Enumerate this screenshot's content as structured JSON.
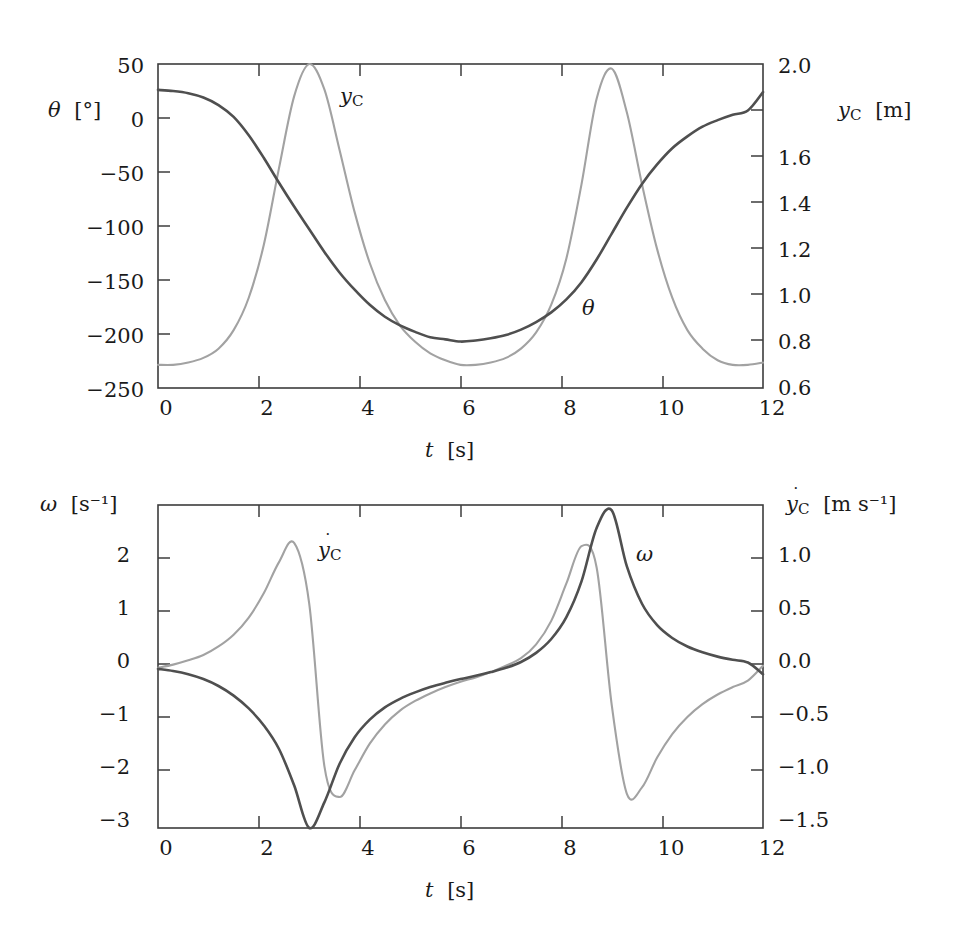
{
  "figure": {
    "background": "#ffffff",
    "curve_colors": {
      "dark": "#4f4f4f",
      "light": "#a2a2a2"
    },
    "axis_color": "#3c3c3c"
  },
  "panels": [
    {
      "id": "top",
      "x_axis": {
        "label_main": "t",
        "label_unit": "[s]",
        "ticks": [
          0,
          2,
          4,
          6,
          8,
          10,
          12
        ],
        "tick_labels": [
          "0",
          "2",
          "4",
          "6",
          "8",
          "10",
          "12"
        ],
        "range": [
          0,
          12
        ]
      },
      "left_axis": {
        "label_main": "θ",
        "label_unit": "[°]",
        "ticks": [
          50,
          0,
          -50,
          -100,
          -150,
          -200,
          -250
        ],
        "tick_labels": [
          "50",
          "0",
          "−50",
          "−100",
          "−150",
          "−200",
          "−250"
        ],
        "range": [
          -250,
          50
        ]
      },
      "right_axis": {
        "label_main": "y",
        "label_sub": "C",
        "label_unit": "[m]",
        "ticks": [
          2.0,
          1.8,
          1.6,
          1.4,
          1.2,
          1.0,
          0.8,
          0.6
        ],
        "tick_labels": [
          "2.0",
          "",
          "1.6",
          "1.4",
          "1.2",
          "1.0",
          "0.8",
          "0.6"
        ],
        "range": [
          0.6,
          2.0
        ]
      },
      "annotations": [
        {
          "name": "y_C",
          "text_main": "y",
          "text_sub": "C",
          "x": 340,
          "y": 96
        },
        {
          "name": "theta",
          "text_main": "θ",
          "text_sub": "",
          "x": 582,
          "y": 300
        }
      ]
    },
    {
      "id": "bottom",
      "x_axis": {
        "label_main": "t",
        "label_unit": "[s]",
        "ticks": [
          0,
          2,
          4,
          6,
          8,
          10,
          12
        ],
        "tick_labels": [
          "0",
          "2",
          "4",
          "6",
          "8",
          "10",
          "12"
        ],
        "range": [
          0,
          12
        ]
      },
      "left_axis": {
        "label_main": "ω",
        "label_unit": "[s⁻¹]",
        "ticks": [
          2,
          1,
          0,
          -1,
          -2,
          -3
        ],
        "tick_labels": [
          "2",
          "1",
          "0",
          "−1",
          "−2",
          "−3"
        ],
        "range": [
          -3.0,
          3.05
        ]
      },
      "right_axis": {
        "label_main": "y",
        "label_sub": "C",
        "label_unit": "[m s⁻¹]",
        "ticks": [
          1.0,
          0.5,
          0.0,
          -0.5,
          -1.0,
          -1.5
        ],
        "tick_labels": [
          "1.0",
          "0.5",
          "0.0",
          "−0.5",
          "−1.0",
          "−1.5"
        ],
        "range": [
          -1.5,
          1.525
        ]
      },
      "annotations": [
        {
          "name": "ydot_C",
          "text_main": "y",
          "text_sub": "C",
          "x": 318,
          "y": 548
        },
        {
          "name": "omega",
          "text_main": "ω",
          "text_sub": "",
          "x": 636,
          "y": 550
        }
      ]
    }
  ],
  "chart_data": [
    {
      "type": "line",
      "panel": "top",
      "title": "",
      "xlabel": "t [s]",
      "ylabel": "θ [°]",
      "ylabel_right": "y_C [m]",
      "xlim": [
        0,
        12
      ],
      "ylim": [
        -250,
        50
      ],
      "ylim_right": [
        0.6,
        2.0
      ],
      "grid": false,
      "legend": "inline annotations",
      "series": [
        {
          "name": "θ",
          "axis": "left",
          "unit": "deg",
          "color": "#4f4f4f",
          "x": [
            0.0,
            0.3,
            0.6,
            0.9,
            1.2,
            1.5,
            1.8,
            2.1,
            2.4,
            2.7,
            3.0,
            3.3,
            3.6,
            3.9,
            4.2,
            4.5,
            4.8,
            5.1,
            5.4,
            5.7,
            6.0,
            6.3,
            6.6,
            6.9,
            7.2,
            7.5,
            7.8,
            8.1,
            8.4,
            8.7,
            9.0,
            9.3,
            9.6,
            9.9,
            10.2,
            10.5,
            10.8,
            11.1,
            11.4,
            11.7,
            12.0
          ],
          "y": [
            26,
            25,
            23,
            19,
            12,
            1,
            -16,
            -37,
            -60,
            -82,
            -103,
            -124,
            -143,
            -159,
            -173,
            -184,
            -192,
            -198,
            -203,
            -205,
            -207,
            -206,
            -204,
            -201,
            -196,
            -189,
            -180,
            -168,
            -152,
            -131,
            -107,
            -83,
            -61,
            -43,
            -28,
            -17,
            -8,
            -2,
            3,
            7,
            24
          ]
        },
        {
          "name": "y_C",
          "axis": "right",
          "unit": "m",
          "color": "#a2a2a2",
          "x": [
            0.0,
            0.3,
            0.6,
            0.9,
            1.2,
            1.5,
            1.8,
            2.1,
            2.4,
            2.7,
            3.0,
            3.3,
            3.6,
            3.9,
            4.2,
            4.5,
            4.8,
            5.1,
            5.4,
            5.7,
            6.0,
            6.3,
            6.6,
            6.9,
            7.2,
            7.5,
            7.8,
            8.1,
            8.4,
            8.7,
            9.0,
            9.3,
            9.6,
            9.9,
            10.2,
            10.5,
            10.8,
            11.1,
            11.4,
            11.7,
            12.0
          ],
          "y": [
            0.7,
            0.7,
            0.71,
            0.73,
            0.77,
            0.85,
            0.99,
            1.22,
            1.55,
            1.86,
            2.0,
            1.89,
            1.63,
            1.36,
            1.14,
            0.98,
            0.87,
            0.8,
            0.75,
            0.72,
            0.7,
            0.7,
            0.71,
            0.73,
            0.77,
            0.84,
            0.96,
            1.16,
            1.48,
            1.85,
            1.98,
            1.79,
            1.48,
            1.2,
            0.99,
            0.85,
            0.77,
            0.72,
            0.7,
            0.7,
            0.71
          ]
        }
      ]
    },
    {
      "type": "line",
      "panel": "bottom",
      "title": "",
      "xlabel": "t [s]",
      "ylabel": "ω [s⁻¹]",
      "ylabel_right": "ẏ_C [m s⁻¹]",
      "xlim": [
        0,
        12
      ],
      "ylim": [
        -3.0,
        3.05
      ],
      "ylim_right": [
        -1.5,
        1.525
      ],
      "grid": false,
      "legend": "inline annotations",
      "series": [
        {
          "name": "ω",
          "axis": "left",
          "unit": "s^-1",
          "color": "#4f4f4f",
          "x": [
            0.0,
            0.3,
            0.6,
            0.9,
            1.2,
            1.5,
            1.8,
            2.1,
            2.4,
            2.7,
            3.0,
            3.3,
            3.6,
            3.9,
            4.2,
            4.5,
            4.8,
            5.1,
            5.4,
            5.7,
            6.0,
            6.3,
            6.6,
            6.9,
            7.2,
            7.5,
            7.8,
            8.1,
            8.4,
            8.7,
            9.0,
            9.3,
            9.6,
            9.9,
            10.2,
            10.5,
            10.8,
            11.1,
            11.4,
            11.7,
            12.0
          ],
          "y": [
            -0.02,
            -0.06,
            -0.12,
            -0.21,
            -0.34,
            -0.52,
            -0.76,
            -1.08,
            -1.52,
            -2.2,
            -3.0,
            -2.52,
            -1.8,
            -1.3,
            -0.97,
            -0.74,
            -0.58,
            -0.46,
            -0.36,
            -0.28,
            -0.21,
            -0.15,
            -0.08,
            0.0,
            0.11,
            0.28,
            0.54,
            0.95,
            1.62,
            2.62,
            2.95,
            1.9,
            1.2,
            0.8,
            0.56,
            0.4,
            0.29,
            0.21,
            0.15,
            0.1,
            -0.12
          ]
        },
        {
          "name": "ẏ_C",
          "axis": "right",
          "unit": "m/s",
          "color": "#a2a2a2",
          "x": [
            0.0,
            0.3,
            0.6,
            0.9,
            1.2,
            1.5,
            1.8,
            2.1,
            2.4,
            2.7,
            3.0,
            3.3,
            3.6,
            3.9,
            4.2,
            4.5,
            4.8,
            5.1,
            5.4,
            5.7,
            6.0,
            6.3,
            6.6,
            6.9,
            7.2,
            7.5,
            7.8,
            8.1,
            8.4,
            8.7,
            9.0,
            9.3,
            9.6,
            9.9,
            10.2,
            10.5,
            10.8,
            11.1,
            11.4,
            11.7,
            12.0
          ],
          "y": [
            0.0,
            0.03,
            0.07,
            0.12,
            0.2,
            0.31,
            0.47,
            0.7,
            0.99,
            1.17,
            0.6,
            -0.92,
            -1.21,
            -0.96,
            -0.71,
            -0.53,
            -0.4,
            -0.31,
            -0.24,
            -0.18,
            -0.13,
            -0.09,
            -0.04,
            0.02,
            0.09,
            0.22,
            0.44,
            0.79,
            1.14,
            0.94,
            -0.35,
            -1.18,
            -1.12,
            -0.84,
            -0.62,
            -0.46,
            -0.34,
            -0.25,
            -0.18,
            -0.12,
            0.02
          ]
        }
      ]
    }
  ]
}
